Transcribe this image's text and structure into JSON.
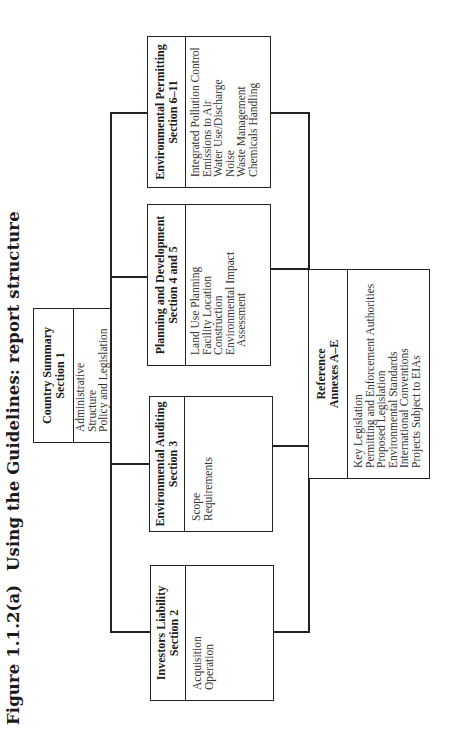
{
  "figure": {
    "number": "Figure 1.1.2(a)",
    "title": "Using the Guidelines: report structure"
  },
  "boxes": {
    "country_summary": {
      "title": "Country Summary",
      "section": "Section 1",
      "items": [
        "Administrative Structure",
        "Policy and Legislation"
      ]
    },
    "investors_liability": {
      "title": "Investors Liability",
      "section": "Section 2",
      "items": [
        "Acquisition",
        "Operation"
      ]
    },
    "environmental_auditing": {
      "title": "Environmental Auditing",
      "section": "Section 3",
      "items": [
        "Scope",
        "Requirements"
      ]
    },
    "planning_development": {
      "title": "Planning and Development",
      "section": "Section 4 and 5",
      "items": [
        "Land Use Planning",
        "Facility Location",
        "Construction",
        "Environmental Impact",
        "Assessment"
      ]
    },
    "environmental_permitting": {
      "title": "Environmental Permitting",
      "section": "Section 6–11",
      "items": [
        "Integrated Pollution Control",
        "Emissions to Air",
        "Water Use/Discharge",
        "Noise",
        "Waste Management",
        "Chemicals Handling"
      ]
    },
    "reference": {
      "title": "Reference",
      "section": "Annexes A–E",
      "items": [
        "Key Legislation",
        "Permitting and Enforcement Authorities",
        "Proposed Legislation",
        "Environmental Standards",
        "International Conventions",
        "Projects Subject to EIAs"
      ]
    }
  }
}
